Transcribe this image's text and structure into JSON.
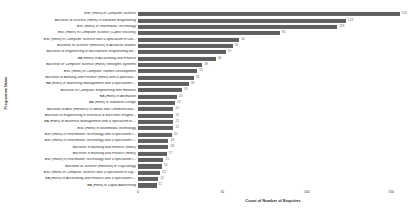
{
  "chart_data": {
    "type": "bar",
    "orientation": "horizontal",
    "title": "",
    "xlabel": "Count of Number of Enquiries",
    "ylabel": "Programme Name",
    "xlim": [
      0,
      160
    ],
    "xticks": [
      "0",
      "50",
      "100",
      "150"
    ],
    "grid": false,
    "legend": "none",
    "bar_color": "#5f5f5f",
    "categories": [
      "BSc (Hons) in Computer Science",
      "Bachelor of Science (Hons) in Software Engineering",
      "BSc (Hons) in Information Technology",
      "BSc (Hons) in Computer Science (Cyber Security)",
      "BSc (Hons) in Computer Science with a specialism in Dat...",
      "Bachelor of Science (Honours) in Actuarial Studies",
      "Bachelor of Engineering in Mechatronic Engineering wit...",
      "BA (Hons) in Accounting and Finance",
      "Bachelor of Computer Science (Hons) Intelligent Systems",
      "BSc (Hons) in Computer Games Development",
      "Bachelor in Banking and Finance (Hons) with a specialis...",
      "BA (Hons) in Marketing Management with a specialism i...",
      "Bachelor of Computer Engineering with Honours",
      "BA (Hons) in Animation",
      "BA (Hons) in Industrial Design",
      "Bachelor of Arts (Honours) in Media and Communicatio...",
      "Bachelor of Engineering in Electrical & Electronic Engine...",
      "BA (Hons) in Business Management with a specialism in ...",
      "BSc (Hons) in Multimedia Technology",
      "BSc (Hons) in Information Technology with a specialism i...",
      "BSc (Hons) in Information Technology with a specialism i...",
      "Bachelor in Banking and Finance (Hons)",
      "Bachelor in Banking and Finance (Hons)",
      "BSc (Hons) in Information Technology with a specialism i...",
      "Bachelor of Science (Honours) in Psychology",
      "BSc (Hons) in Computer Science with a specialism in Dig...",
      "BA (Hons) in Accounting and Finance with a specialism i...",
      "BA (Hons) in Digital Advertising"
    ],
    "values": [
      155,
      123,
      118,
      84,
      60,
      56,
      52,
      46,
      38,
      35,
      33,
      30,
      26,
      23,
      22,
      21,
      21,
      21,
      21,
      20,
      18,
      18,
      17,
      15,
      14,
      13,
      12,
      11
    ]
  }
}
